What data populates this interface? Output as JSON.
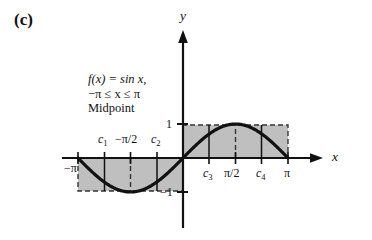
{
  "panel": {
    "label": "(c)"
  },
  "caption": {
    "line1": "f(x) = sin x,",
    "line2": "−π ≤ x ≤ π",
    "line3": "Midpoint"
  },
  "axes": {
    "x_label": "x",
    "y_label": "y",
    "y_tick_pos": "1",
    "y_tick_neg": "−1"
  },
  "x_ticks": [
    {
      "name": "neg-pi",
      "text": "−π",
      "x": -3.14159,
      "placement": "below"
    },
    {
      "name": "c1",
      "text": "c",
      "sub": "1",
      "x": -2.35619,
      "placement": "above"
    },
    {
      "name": "neg-pi-half",
      "text": "−π/2",
      "x": -1.5708,
      "placement": "above"
    },
    {
      "name": "c2",
      "text": "c",
      "sub": "2",
      "x": -0.7854,
      "placement": "above"
    },
    {
      "name": "c3",
      "text": "c",
      "sub": "3",
      "x": 0.7854,
      "placement": "below"
    },
    {
      "name": "pi-half",
      "text": "π/2",
      "x": 1.5708,
      "placement": "below"
    },
    {
      "name": "c4",
      "text": "c",
      "sub": "4",
      "x": 2.35619,
      "placement": "below"
    },
    {
      "name": "pi",
      "text": "π",
      "x": 3.14159,
      "placement": "below"
    }
  ],
  "chart_data": {
    "type": "line",
    "xlabel": "x",
    "ylabel": "y",
    "xlim": [
      -3.14159,
      3.14159
    ],
    "ylim": [
      -1.15,
      1.15
    ],
    "grid": false,
    "legend": null,
    "function": "sin(x)",
    "series": [
      {
        "name": "f(x) = sin x",
        "x": [
          -3.14159,
          -2.74889,
          -2.35619,
          -1.9635,
          -1.5708,
          -1.1781,
          -0.7854,
          -0.3927,
          0.0,
          0.3927,
          0.7854,
          1.1781,
          1.5708,
          1.9635,
          2.35619,
          2.74889,
          3.14159
        ],
        "y": [
          0.0,
          -0.38268,
          -0.70711,
          -0.92388,
          -1.0,
          -0.92388,
          -0.70711,
          -0.38268,
          0.0,
          0.38268,
          0.70711,
          0.92388,
          1.0,
          0.92388,
          0.70711,
          0.38268,
          0.0
        ]
      }
    ],
    "midpoints": [
      {
        "label": "c1",
        "x": -2.35619,
        "fx": -0.70711
      },
      {
        "label": "c2",
        "x": -0.7854,
        "fx": -0.70711
      },
      {
        "label": "c3",
        "x": 0.7854,
        "fx": 0.70711
      },
      {
        "label": "c4",
        "x": 2.35619,
        "fx": 0.70711
      }
    ],
    "rectangles": [
      {
        "name": "left-rectangle",
        "x0": -3.14159,
        "x1": 0.0,
        "height": -0.70711,
        "midpoints": [
          "c1",
          "c2"
        ]
      },
      {
        "name": "right-rectangle",
        "x0": 0.0,
        "x1": 3.14159,
        "height": 0.70711,
        "midpoints": [
          "c3",
          "c4"
        ]
      }
    ],
    "annotations": [
      "f(x) = sin x,",
      "−π ≤ x ≤ π",
      "Midpoint"
    ]
  },
  "style": {
    "shade_fill": "#bfbfbf",
    "curve_color": "#111111",
    "axis_color": "#111111",
    "dash_color": "#333333",
    "background": "#ffffff"
  }
}
